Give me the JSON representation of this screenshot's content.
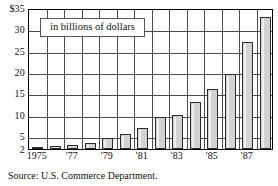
{
  "chart_data": {
    "type": "bar",
    "title": "in billions of dollars",
    "xlabel": "",
    "ylabel": "",
    "ylim": [
      2,
      35
    ],
    "grid": true,
    "legend_position": "none",
    "source": "Source: U.S. Commerce Department.",
    "categories": [
      "1975",
      "1976",
      "1977",
      "1978",
      "1979",
      "1980",
      "1981",
      "1982",
      "1983",
      "1984",
      "1985",
      "1986",
      "1987",
      "1988"
    ],
    "tick_labels_x": [
      "1975",
      "'77",
      "'79",
      "'81",
      "'83",
      "'85",
      "'87"
    ],
    "tick_values_x": [
      "1975",
      "1977",
      "1979",
      "1981",
      "1983",
      "1985",
      "1987"
    ],
    "tick_labels_y": [
      "$35",
      "30",
      "25",
      "20",
      "15",
      "10",
      "5",
      "2"
    ],
    "tick_values_y": [
      35,
      30,
      25,
      20,
      15,
      10,
      5,
      2
    ],
    "values": [
      2.5,
      2.7,
      3.0,
      3.5,
      4.5,
      5.5,
      7.0,
      9.5,
      10.0,
      13.0,
      16.0,
      19.5,
      27.0,
      33.0
    ],
    "colors": {
      "bar_fill": "#d2d2d2",
      "bar_edge": "#2b2b2b",
      "grid": "#4a4a4a",
      "frame": "#000000",
      "background": "#ffffff",
      "text": "#111111"
    }
  }
}
